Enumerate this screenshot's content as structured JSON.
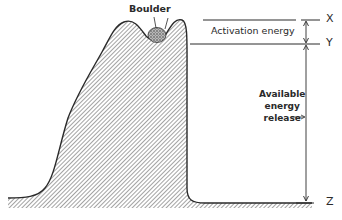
{
  "figure": {
    "type": "energy diagram",
    "labels": {
      "boulder": "Boulder",
      "activation_energy": "Activation energy",
      "available_energy_release": [
        "Available",
        "energy",
        "release"
      ],
      "level_x": "X",
      "level_y": "Y",
      "level_z": "Z"
    },
    "colors": {
      "line": "#2a2a2a",
      "hatch": "#555555",
      "background": "#ffffff"
    }
  }
}
